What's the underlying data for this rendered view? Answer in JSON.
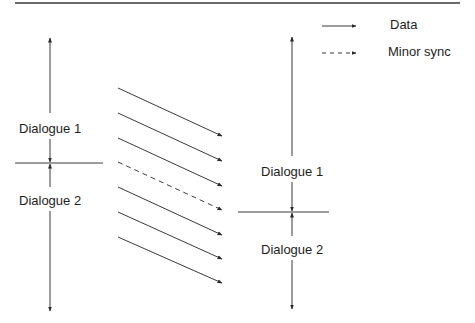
{
  "diagram": {
    "type": "timing-sequence",
    "colors": {
      "line": "#3a3a3a",
      "text": "#1e1e1e",
      "background": "#ffffff"
    },
    "top_rule": {
      "x1": 15,
      "x2": 460,
      "y": 3
    },
    "legend": [
      {
        "label": "Data",
        "style": "solid",
        "x1": 322,
        "x2": 356,
        "y": 26,
        "label_x": 390,
        "label_y": 18
      },
      {
        "label": "Minor sync",
        "style": "dashed",
        "x1": 322,
        "x2": 356,
        "y": 53,
        "label_x": 388,
        "label_y": 45
      }
    ],
    "left_timeline": {
      "x": 50,
      "top": 38,
      "bottom": 311,
      "boundary_y": 163,
      "boundary_x1": 15,
      "boundary_x2": 103,
      "dialogues": [
        {
          "label": "Dialogue 1",
          "center_y": 128
        },
        {
          "label": "Dialogue 2",
          "center_y": 200
        }
      ]
    },
    "right_timeline": {
      "x": 292,
      "top": 37,
      "bottom": 309,
      "boundary_y": 212,
      "boundary_x1": 238,
      "boundary_x2": 329,
      "dialogues": [
        {
          "label": "Dialogue 1",
          "center_y": 171
        },
        {
          "label": "Dialogue 2",
          "center_y": 249
        }
      ]
    },
    "messages": [
      {
        "kind": "Data",
        "style": "solid",
        "x1": 118,
        "y1": 88,
        "x2": 222,
        "y2": 136
      },
      {
        "kind": "Data",
        "style": "solid",
        "x1": 118,
        "y1": 113,
        "x2": 222,
        "y2": 161
      },
      {
        "kind": "Data",
        "style": "solid",
        "x1": 118,
        "y1": 138,
        "x2": 222,
        "y2": 186
      },
      {
        "kind": "Minor sync",
        "style": "dashed",
        "x1": 118,
        "y1": 162,
        "x2": 222,
        "y2": 210
      },
      {
        "kind": "Data",
        "style": "solid",
        "x1": 118,
        "y1": 187,
        "x2": 222,
        "y2": 235
      },
      {
        "kind": "Data",
        "style": "solid",
        "x1": 118,
        "y1": 212,
        "x2": 222,
        "y2": 259
      },
      {
        "kind": "Data",
        "style": "solid",
        "x1": 118,
        "y1": 237,
        "x2": 222,
        "y2": 283
      }
    ]
  }
}
